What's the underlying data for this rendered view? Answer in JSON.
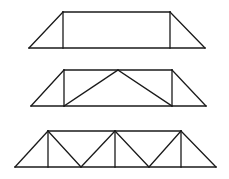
{
  "diagram": {
    "background": "#ffffff",
    "stroke_color": "#1a1a1a",
    "stroke_width": 1.3,
    "trusses": [
      {
        "name": "truss-1-simple",
        "members": [
          [
            29,
            48,
            205,
            48
          ],
          [
            63,
            12,
            170,
            12
          ],
          [
            29,
            48,
            63,
            12
          ],
          [
            170,
            12,
            205,
            48
          ],
          [
            63,
            12,
            63,
            48
          ],
          [
            170,
            12,
            170,
            48
          ]
        ]
      },
      {
        "name": "truss-2-king-post",
        "members": [
          [
            31,
            106,
            206,
            106
          ],
          [
            64,
            70,
            172,
            70
          ],
          [
            31,
            106,
            64,
            70
          ],
          [
            172,
            70,
            206,
            106
          ],
          [
            64,
            70,
            64,
            106
          ],
          [
            172,
            70,
            172,
            106
          ],
          [
            64,
            106,
            118,
            70
          ],
          [
            118,
            70,
            172,
            106
          ]
        ]
      },
      {
        "name": "truss-3-warren-with-verticals",
        "members": [
          [
            15,
            167,
            216,
            167
          ],
          [
            48,
            131,
            181,
            131
          ],
          [
            15,
            167,
            48,
            131
          ],
          [
            181,
            131,
            216,
            167
          ],
          [
            48,
            131,
            48,
            167
          ],
          [
            115,
            131,
            115,
            167
          ],
          [
            181,
            131,
            181,
            167
          ],
          [
            48,
            131,
            81,
            167
          ],
          [
            81,
            167,
            115,
            131
          ],
          [
            115,
            131,
            149,
            167
          ],
          [
            149,
            167,
            181,
            131
          ]
        ]
      }
    ]
  }
}
